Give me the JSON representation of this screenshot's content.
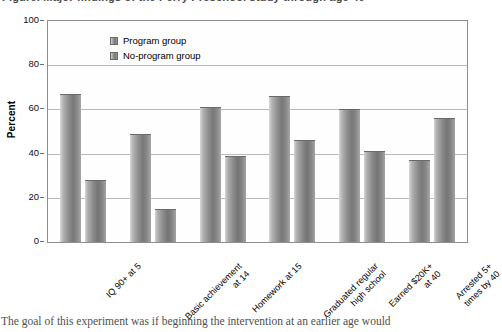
{
  "figure": {
    "cutoff_title": "Figure. Major findings of the Perry Preschool study through age 40",
    "cutoff_bodytext": "The goal of this experiment was if beginning the intervention at an earlier age would"
  },
  "legend": {
    "position": "top-left-inside",
    "items": [
      {
        "label": "Program group",
        "swatch": "bar-swatch"
      },
      {
        "label": "No-program group",
        "swatch": "bar-swatch"
      }
    ]
  },
  "axes": {
    "ylabel": "Percent",
    "yticks": [
      "0",
      "20",
      "40",
      "60",
      "80",
      "100"
    ],
    "ylim": [
      0,
      100
    ],
    "grid": true
  },
  "chart_data": {
    "type": "bar",
    "title": "",
    "xlabel": "",
    "ylabel": "Percent",
    "ylim": [
      0,
      100
    ],
    "grid": true,
    "legend_position": "top-left-inside",
    "categories": [
      "IQ 90+ at 5",
      "Basic achievement at 14",
      "Homework at 15",
      "Graduated regular high school",
      "Earned $20K+ at 40",
      "Arrested 5+ times by 40"
    ],
    "category_lines": [
      [
        "IQ 90+ at 5"
      ],
      [
        "Basic achievement",
        "at 14"
      ],
      [
        "Homework at 15"
      ],
      [
        "Graduated regular",
        "high school"
      ],
      [
        "Earned $20K+",
        "at 40"
      ],
      [
        "Arrested 5+",
        "times by 40"
      ]
    ],
    "series": [
      {
        "name": "Program group",
        "values": [
          67,
          49,
          61,
          66,
          60,
          37
        ]
      },
      {
        "name": "No-program group",
        "values": [
          28,
          15,
          39,
          46,
          41,
          56
        ]
      }
    ],
    "colors": {
      "bar_light": "#d9d9d9",
      "bar_dark": "#787878",
      "gridline": "#b9b9b9",
      "frame": "#8d8d8d",
      "text": "#000000"
    }
  }
}
